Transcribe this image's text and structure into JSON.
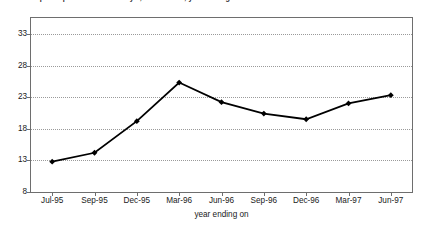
{
  "figure": {
    "clipped_caption": "Graph: Representation of X by Y, index value, year ending on"
  },
  "chart_data": {
    "type": "line",
    "title": "",
    "xlabel": "year ending on",
    "ylabel": "",
    "categories": [
      "Jul-95",
      "Sep-95",
      "Dec-95",
      "Mar-96",
      "Jun-96",
      "Sep-96",
      "Dec-96",
      "Mar-97",
      "Jun-97"
    ],
    "values": [
      12.8,
      14.2,
      19.2,
      25.3,
      22.2,
      20.4,
      19.5,
      22.0,
      23.3
    ],
    "ylim": [
      8,
      35.5
    ],
    "yticks": [
      8,
      13,
      18,
      23,
      28,
      33
    ],
    "ytick_labels": [
      "8",
      "13",
      "18",
      "23",
      "28",
      "33"
    ],
    "grid": "horizontal-dotted",
    "legend": "none",
    "marker": "diamond",
    "line_color": "#000000",
    "grid_color": "#9a9a9a",
    "axis_color": "#6e6e6e"
  }
}
